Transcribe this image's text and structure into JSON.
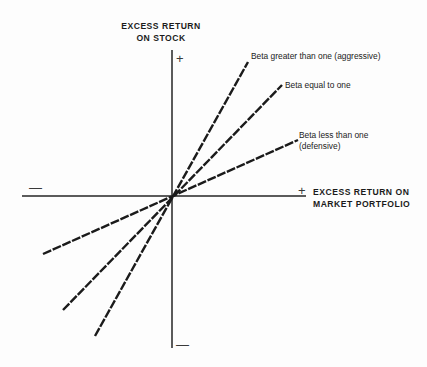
{
  "figure": {
    "background_color": "#fdfdfd",
    "line_color": "#1b1b1b",
    "axis_color": "#5b5b5b"
  },
  "axes": {
    "y_title": "EXCESS RETURN\nON STOCK",
    "x_title": "EXCESS RETURN ON\nMARKET PORTFOLIO",
    "sign_top": "+",
    "sign_bottom": "—",
    "sign_left": "—",
    "sign_right": "+"
  },
  "annotations": {
    "aggressive": "Beta greater than one (aggressive)",
    "equal": "Beta equal to one",
    "defensive": "Beta less than one\n(defensive)"
  },
  "chart_data": {
    "type": "line",
    "xlabel": "EXCESS RETURN ON MARKET PORTFOLIO",
    "ylabel": "EXCESS RETURN ON STOCK",
    "grid": false,
    "legend": "inline-annotations",
    "xlim": [
      -1.95,
      1.75
    ],
    "ylim": [
      -2.2,
      1.75
    ],
    "origin_px": [
      172,
      196
    ],
    "series": [
      {
        "name": "Beta greater than one (aggressive)",
        "beta_slope": 1.76,
        "style": "dashed",
        "x": [
          -1.04,
          0,
          1.0
        ],
        "y": [
          -1.83,
          0,
          1.76
        ],
        "endpoint_px_negative": [
          95,
          336
        ],
        "endpoint_px_positive": [
          248,
          62
        ],
        "label": "Beta greater than one (aggressive)"
      },
      {
        "name": "Beta equal to one",
        "beta_slope": 1.0,
        "style": "dashed",
        "x": [
          -1.22,
          0,
          1.22
        ],
        "y": [
          -1.22,
          0,
          1.22
        ],
        "endpoint_px_negative": [
          63,
          310
        ],
        "endpoint_px_positive": [
          282,
          85
        ],
        "label": "Beta equal to one"
      },
      {
        "name": "Beta less than one (defensive)",
        "beta_slope": 0.44,
        "style": "dashed",
        "x": [
          -1.48,
          0,
          1.44
        ],
        "y": [
          -0.65,
          0,
          0.63
        ],
        "endpoint_px_negative": [
          43,
          254
        ],
        "endpoint_px_positive": [
          298,
          140
        ],
        "label": "Beta less than one (defensive)"
      }
    ]
  }
}
